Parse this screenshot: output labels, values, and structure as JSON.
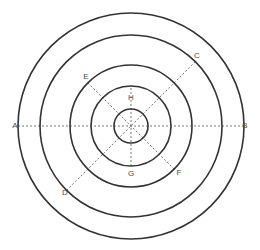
{
  "figure": {
    "background_color": "#ffffff",
    "stroke_color": "#333333",
    "dash_color": "#555555",
    "label_color": "#4a4a4a",
    "center": {
      "x": 131,
      "y": 126
    },
    "circles": [
      {
        "name": "outer-circle-1",
        "radius": 113,
        "stroke_width": 1.6
      },
      {
        "name": "circle-2",
        "radius": 91,
        "stroke_width": 1.6
      },
      {
        "name": "circle-3",
        "radius": 61,
        "stroke_width": 1.6
      },
      {
        "name": "circle-4",
        "radius": 40,
        "stroke_width": 1.6
      },
      {
        "name": "inner-circle-5",
        "radius": 17,
        "stroke_width": 1.6
      }
    ],
    "axes": [
      {
        "name": "horizontal-axis",
        "angle_deg": 0,
        "extent_radius": 113,
        "style": "dashed",
        "endpoints": [
          "A",
          "B"
        ]
      },
      {
        "name": "diagonal-axis",
        "angle_deg": 45,
        "extent_radius": 91,
        "style": "dashed",
        "endpoints": [
          "C",
          "D"
        ]
      },
      {
        "name": "diagonal-axis-secondary",
        "angle_deg": 135,
        "extent_radius": 61,
        "style": "dashed",
        "endpoints": [
          "E",
          "F"
        ]
      },
      {
        "name": "vertical-axis",
        "angle_deg": 90,
        "extent_radius": 40,
        "style": "dashed",
        "endpoints": [
          "H",
          "G"
        ]
      }
    ],
    "labels": [
      {
        "id": "A",
        "text": "A",
        "x": 15,
        "y": 126,
        "anchor_circle": "outer-circle-1",
        "direction": "left"
      },
      {
        "id": "B",
        "text": "B",
        "x": 245,
        "y": 126,
        "anchor_circle": "outer-circle-1",
        "direction": "right"
      },
      {
        "id": "C",
        "text": "C",
        "x": 197,
        "y": 56,
        "anchor_circle": "circle-2",
        "direction": "upper-right"
      },
      {
        "id": "D",
        "text": "D",
        "x": 65,
        "y": 193,
        "anchor_circle": "circle-2",
        "direction": "lower-left"
      },
      {
        "id": "E",
        "text": "E",
        "x": 86,
        "y": 77,
        "anchor_circle": "circle-3",
        "direction": "upper-left"
      },
      {
        "id": "F",
        "text": "F",
        "x": 179,
        "y": 173,
        "anchor_circle": "circle-3",
        "direction": "lower-right"
      },
      {
        "id": "G",
        "text": "G",
        "x": 131,
        "y": 174,
        "anchor_circle": "circle-4",
        "direction": "down"
      },
      {
        "id": "H",
        "text": "H",
        "x": 131,
        "y": 98,
        "anchor_circle": "circle-4",
        "direction": "up"
      }
    ]
  }
}
